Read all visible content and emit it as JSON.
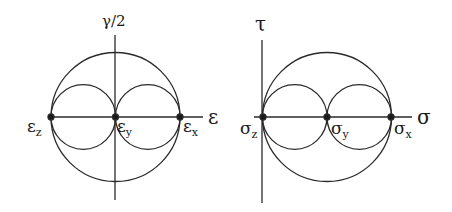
{
  "left_diagram": {
    "title": "Mohr's strain circles",
    "vertical_axis_label": "γ/2",
    "horizontal_axis_label": "ε",
    "points": [
      {
        "symbol": "ε",
        "subscript": "z"
      },
      {
        "symbol": "ε",
        "subscript": "y"
      },
      {
        "symbol": "ε",
        "subscript": "x"
      }
    ]
  },
  "right_diagram": {
    "title": "Mohr's stress circles",
    "vertical_axis_label": "τ",
    "horizontal_axis_label": "σ",
    "points": [
      {
        "symbol": "σ",
        "subscript": "z"
      },
      {
        "symbol": "σ",
        "subscript": "y"
      },
      {
        "symbol": "σ",
        "subscript": "x"
      }
    ]
  },
  "colors": {
    "stroke": "#2a2a2a",
    "background": "#ffffff"
  }
}
